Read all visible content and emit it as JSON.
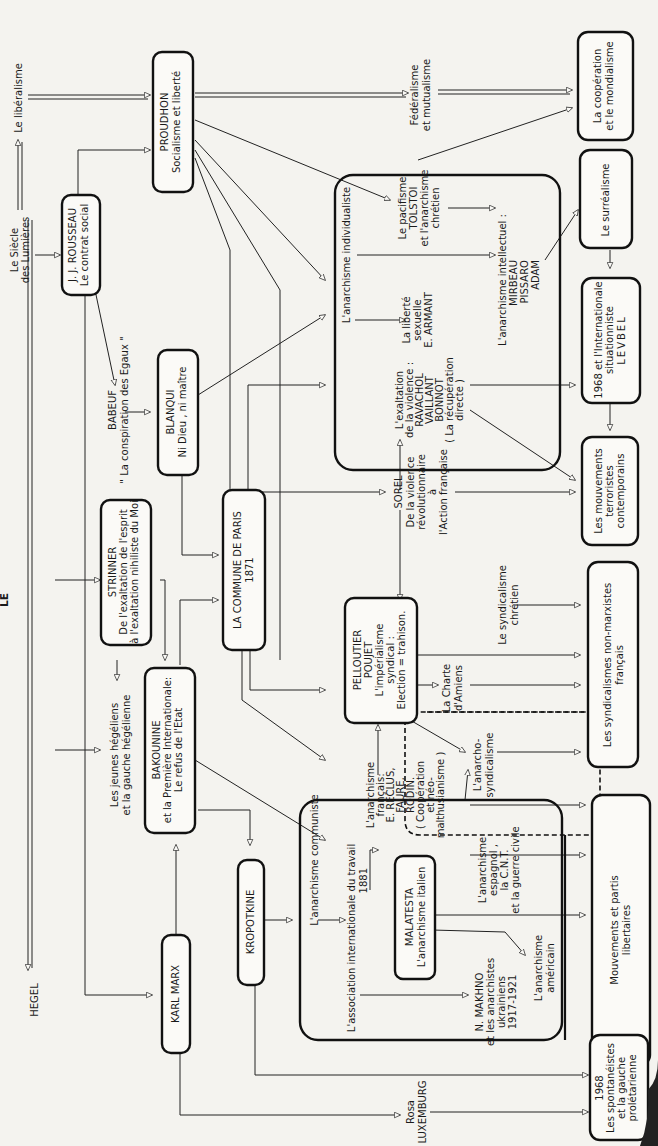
{
  "diagram": {
    "orientation": "rotated-90-ccw",
    "page_title_fragment": "LE",
    "nodes": {
      "hegel": {
        "lines": [
          "HEGEL"
        ]
      },
      "siecle_lumieres": {
        "lines": [
          "Le Siècle",
          "des Lumières"
        ]
      },
      "liberalisme": {
        "lines": [
          "Le libéralisme"
        ]
      },
      "rousseau": {
        "lines": [
          "J. J. ROUSSEAU",
          "Le contrat social"
        ]
      },
      "proudhon": {
        "lines": [
          "PROUDHON",
          "Socialisme et liberté"
        ]
      },
      "federalisme": {
        "lines": [
          "Fédéralisme",
          "et mutualisme"
        ]
      },
      "cooperation": {
        "lines": [
          "La coopération",
          "et le mondialisme"
        ]
      },
      "babeuf": {
        "lines": [
          "BABEUF",
          "\" La conspiration des Egaux \""
        ]
      },
      "blanqui": {
        "lines": [
          "BLANQUI",
          "Ni Dieu , ni maître"
        ]
      },
      "strinner": {
        "lines": [
          "STRINNER",
          "De l'exaltation de l'esprit",
          "à l'exaltation nihiliste du Moi"
        ]
      },
      "jeunes_hegeliens": {
        "lines": [
          "Les jeunes hégéliens",
          "et la gauche hégélienne"
        ]
      },
      "bakounine": {
        "lines": [
          "BAKOUNINE",
          "et la Première Internationale:",
          "Le refus de l'Etat"
        ]
      },
      "commune": {
        "lines": [
          "LA COMMUNE DE PARIS",
          "1871"
        ]
      },
      "karl_marx": {
        "lines": [
          "KARL MARX"
        ]
      },
      "kropotkine": {
        "lines": [
          "KROPOTKINE"
        ]
      },
      "anarchisme_individualiste": {
        "lines": [
          "L'anarchisme individualiste"
        ]
      },
      "liberte_sexuelle": {
        "lines": [
          "La liberté",
          "sexuelle",
          "E. ARMANT"
        ]
      },
      "pacifisme": {
        "lines": [
          "Le pacifisme",
          "TOLSTOI",
          "et l'anarchisme",
          "chrétien"
        ]
      },
      "anarchisme_intellectuel": {
        "lines": [
          "L'anarchisme intellectuel :",
          "MIRBEAU",
          "PISSARO",
          "ADAM"
        ]
      },
      "surrealisme": {
        "lines": [
          "Le surréalisme"
        ]
      },
      "exaltation_violence": {
        "lines": [
          "L'exaltation",
          "de la violence :",
          "RAVACHOL",
          "VAILLANT",
          "BONNOT",
          "( La récupération",
          "directe )"
        ]
      },
      "internationale_situ": {
        "lines": [
          "1968 et l'Internationale",
          "situationniste",
          "LEVBEL"
        ]
      },
      "sorel": {
        "lines": [
          "SOREL",
          "De la violence",
          "révolutionnaire",
          "à",
          "l'Action française"
        ]
      },
      "terroristes": {
        "lines": [
          "Les mouvements",
          "terroristes",
          "contemporains"
        ]
      },
      "pelloutier": {
        "lines": [
          "PELLOUTIER",
          "POUJET",
          "L'impérialisme",
          "syndical :",
          "Election = trahison."
        ]
      },
      "syndicalisme_chretien": {
        "lines": [
          "Le syndicalisme",
          "chrétien"
        ]
      },
      "charte_amiens": {
        "lines": [
          "La Charte",
          "d'Amiens"
        ]
      },
      "syndicalismes_non_marxistes": {
        "lines": [
          "Les syndicalismes non-marxistes",
          "français"
        ]
      },
      "anarcho_syndicalisme": {
        "lines": [
          "L'anarcho-",
          "syndicalisme"
        ]
      },
      "anarchisme_francais": {
        "lines": [
          "L'anarchisme",
          "français:",
          "E. RECLUS,",
          "FAURE,",
          "RODIN.",
          "( Coopération",
          "et néo-",
          "malthusianisme )"
        ]
      },
      "anarchisme_communiste": {
        "lines": [
          "L'anarchisme communiste"
        ]
      },
      "association_internationale": {
        "lines": [
          "L'association internationale du travail",
          "1881"
        ]
      },
      "malatesta": {
        "lines": [
          "MALATESTA",
          "L'anarchisme italien"
        ]
      },
      "anarchisme_espagnol": {
        "lines": [
          "L'anarchisme",
          "espagnol ,",
          "la C.N.T.",
          "et la guerre civile"
        ]
      },
      "makhno": {
        "lines": [
          "N. MAKHNO",
          "et les anarchistes",
          "ukrainiens",
          "1917-1921"
        ]
      },
      "anarchisme_americain": {
        "lines": [
          "L'anarchisme",
          "américain"
        ]
      },
      "mouvements_libertaires": {
        "lines": [
          "Mouvements et partis",
          "libertaires"
        ]
      },
      "rosa": {
        "lines": [
          "Rosa",
          "LUXEMBURG"
        ]
      },
      "spontaneistes": {
        "lines": [
          "1968",
          "Les spontanéistes",
          "et la gauche",
          "prolétarienne"
        ]
      }
    }
  }
}
